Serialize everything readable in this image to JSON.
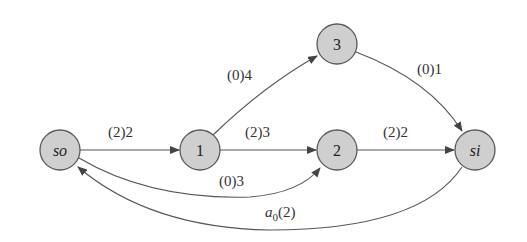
{
  "nodes": {
    "so": {
      "label": "so"
    },
    "n1": {
      "label": "1"
    },
    "n2": {
      "label": "2"
    },
    "n3": {
      "label": "3"
    },
    "si": {
      "label": "si"
    }
  },
  "edges": {
    "so_1": {
      "label": "(2)2"
    },
    "one_3": {
      "label": "(0)4"
    },
    "one_2": {
      "label": "(2)3"
    },
    "so_2": {
      "label": "(0)3"
    },
    "two_si": {
      "label": "(2)2"
    },
    "three_si": {
      "label": "(0)1"
    },
    "si_so": {
      "label_base": "a",
      "label_sub": "0",
      "label_rest": "(2)"
    }
  },
  "colors": {
    "node_fill": "#cfcfcf",
    "stroke": "#555555"
  }
}
